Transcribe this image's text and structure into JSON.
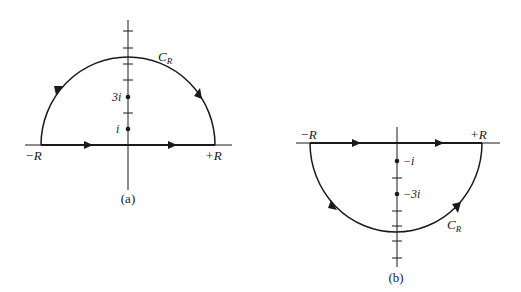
{
  "figure_a": {
    "caption": "(a)",
    "contour_label": "C",
    "contour_subscript": "R",
    "left_endpoint": "−R",
    "right_endpoint": "+R",
    "points": [
      {
        "label": "3i",
        "value": 3
      },
      {
        "label": "i",
        "value": 1
      }
    ],
    "description": "Upper semicircular contour, counterclockwise"
  },
  "figure_b": {
    "caption": "(b)",
    "contour_label": "C",
    "contour_subscript": "R",
    "left_endpoint": "−R",
    "right_endpoint": "+R",
    "points": [
      {
        "label": "−i",
        "value": -1
      },
      {
        "label": "−3i",
        "value": -3
      }
    ],
    "description": "Lower semicircular contour, clockwise"
  },
  "colors": {
    "stroke": "#1a1a1a",
    "background": "#ffffff"
  }
}
